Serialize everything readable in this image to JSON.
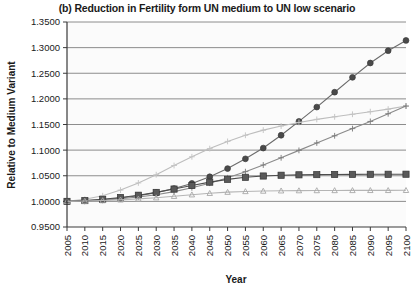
{
  "chart_data": {
    "type": "line",
    "title": "(b) Reduction in Fertility form UN medium to UN low scenario",
    "xlabel": "Year",
    "ylabel": "Relative to Medium Variant",
    "grid": true,
    "legend": "none",
    "xlim": [
      2005,
      2100
    ],
    "ylim": [
      0.95,
      1.35
    ],
    "ytick_labels": [
      "0.9500",
      "1.0000",
      "1.0500",
      "1.1000",
      "1.1500",
      "1.2000",
      "1.2500",
      "1.3000",
      "1.3500"
    ],
    "ytick_values": [
      0.95,
      1.0,
      1.05,
      1.1,
      1.15,
      1.2,
      1.25,
      1.3,
      1.35
    ],
    "categories": [
      2005,
      2010,
      2015,
      2020,
      2025,
      2030,
      2035,
      2040,
      2045,
      2050,
      2055,
      2060,
      2065,
      2070,
      2075,
      2080,
      2085,
      2090,
      2095,
      2100
    ],
    "series": [
      {
        "name": "series-circle-dark",
        "marker": "circle",
        "color": "#6b6b6b",
        "marker_color": "#4a4a4a",
        "values": [
          1.0,
          1.001,
          1.003,
          1.0065,
          1.011,
          1.017,
          1.025,
          1.035,
          1.048,
          1.064,
          1.083,
          1.104,
          1.129,
          1.156,
          1.184,
          1.213,
          1.242,
          1.27,
          1.294,
          1.314
        ]
      },
      {
        "name": "series-light-plateau",
        "marker": "cross-light",
        "color": "#bdbdbd",
        "marker_color": "#c4c4c4",
        "values": [
          1.0,
          1.004,
          1.011,
          1.022,
          1.036,
          1.052,
          1.07,
          1.087,
          1.103,
          1.117,
          1.129,
          1.139,
          1.147,
          1.154,
          1.16,
          1.165,
          1.17,
          1.175,
          1.18,
          1.186
        ]
      },
      {
        "name": "series-plus-gray",
        "marker": "plus",
        "color": "#8a8a8a",
        "marker_color": "#7d7d7d",
        "values": [
          1.0,
          1.001,
          1.0025,
          1.005,
          1.0085,
          1.013,
          1.019,
          1.0265,
          1.0355,
          1.046,
          1.058,
          1.071,
          1.085,
          1.0995,
          1.114,
          1.128,
          1.142,
          1.156,
          1.171,
          1.186
        ]
      },
      {
        "name": "series-square-dark",
        "marker": "square",
        "color": "#4d4d4d",
        "marker_color": "#595959",
        "values": [
          1.0,
          1.0015,
          1.004,
          1.0075,
          1.012,
          1.0175,
          1.024,
          1.031,
          1.0375,
          1.043,
          1.047,
          1.0495,
          1.051,
          1.0518,
          1.0522,
          1.0525,
          1.0527,
          1.0528,
          1.0529,
          1.053
        ]
      },
      {
        "name": "series-triangle-light",
        "marker": "triangle",
        "color": "#b5b5b5",
        "marker_color": "#a8a8a8",
        "values": [
          1.0,
          1.0006,
          1.0016,
          1.003,
          1.0048,
          1.0072,
          1.01,
          1.013,
          1.0158,
          1.018,
          1.0194,
          1.0202,
          1.0207,
          1.021,
          1.0212,
          1.0213,
          1.0214,
          1.0215,
          1.0215,
          1.0216
        ]
      }
    ]
  },
  "colors": {
    "axis": "#3a3a3a",
    "grid": "#808080",
    "plot_bg": "#fbfbfb",
    "text": "#1a1a1a"
  }
}
